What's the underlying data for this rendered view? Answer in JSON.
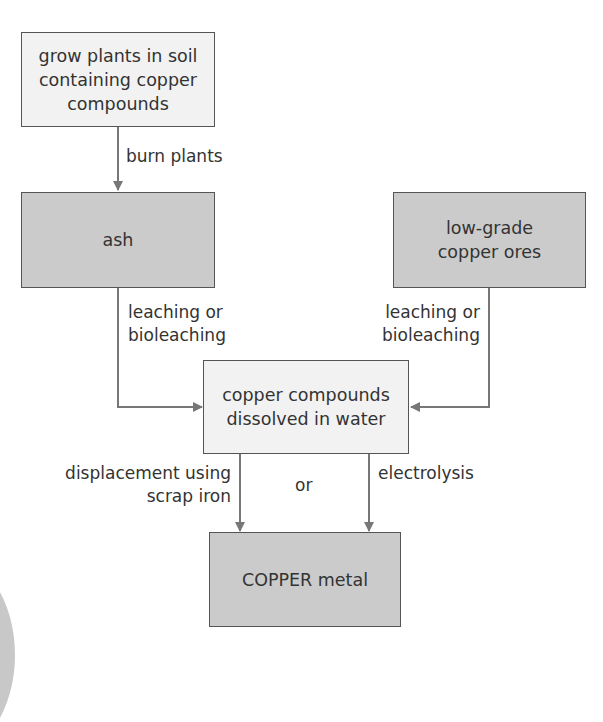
{
  "diagram": {
    "title": "",
    "nodes": {
      "grow_plants": "grow plants in soil containing copper compounds",
      "grow_plants_lines": [
        "grow plants in soil",
        "containing copper",
        "compounds"
      ],
      "ash": "ash",
      "low_grade_ores": "low-grade copper ores",
      "low_grade_ores_lines": [
        "low-grade",
        "copper ores"
      ],
      "dissolved": "copper compounds dissolved in water",
      "dissolved_lines": [
        "copper compounds",
        "dissolved in water"
      ],
      "copper_metal": "COPPER metal"
    },
    "edges": {
      "burn": "burn plants",
      "leach_left_lines": [
        "leaching or",
        "bioleaching"
      ],
      "leach_right_lines": [
        "leaching or",
        "bioleaching"
      ],
      "displacement_lines": [
        "displacement using",
        "scrap iron"
      ],
      "or": "or",
      "electrolysis": "electrolysis"
    },
    "colors": {
      "light_box": "#f2f2f2",
      "dark_box": "#cbcbcb",
      "line": "#777777",
      "text": "#333333"
    }
  }
}
